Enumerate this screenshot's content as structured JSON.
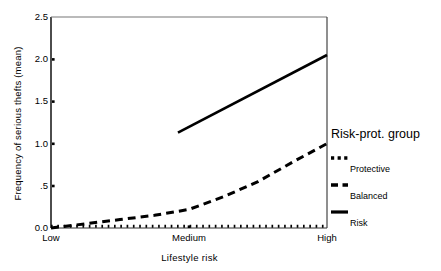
{
  "chart_data": {
    "type": "line",
    "title": "",
    "xlabel": "Lifestyle risk",
    "ylabel": "Frequency of serious thefts (mean)",
    "categories": [
      "Low",
      "Medium",
      "High"
    ],
    "x": [
      0,
      1,
      2
    ],
    "xlim": [
      0,
      2
    ],
    "ylim": [
      0.0,
      2.5
    ],
    "yticks": [
      0.0,
      0.5,
      1.0,
      1.5,
      2.0,
      2.5
    ],
    "ytick_labels": [
      "0.0",
      ".5",
      "1.0",
      "1.5",
      "2.0",
      "2.5"
    ],
    "xtick_labels": [
      "Low",
      "Medium",
      "High"
    ],
    "grid": false,
    "legend_position": "right",
    "legend_title": "Risk-prot. group",
    "series": [
      {
        "name": "Protective",
        "style": "dotted",
        "color": "#000000",
        "values": [
          0.02,
          0.02,
          0.02
        ],
        "points": [
          {
            "x": 0.0,
            "y": 0.02
          },
          {
            "x": 1.0,
            "y": 0.02
          },
          {
            "x": 2.0,
            "y": 0.02
          }
        ]
      },
      {
        "name": "Balanced",
        "style": "dashed",
        "color": "#000000",
        "values": [
          0.0,
          0.22,
          1.0
        ],
        "points": [
          {
            "x": 0.0,
            "y": 0.0
          },
          {
            "x": 0.25,
            "y": 0.05
          },
          {
            "x": 0.5,
            "y": 0.1
          },
          {
            "x": 0.75,
            "y": 0.15
          },
          {
            "x": 1.0,
            "y": 0.22
          },
          {
            "x": 1.25,
            "y": 0.37
          },
          {
            "x": 1.5,
            "y": 0.55
          },
          {
            "x": 1.75,
            "y": 0.78
          },
          {
            "x": 2.0,
            "y": 1.0
          }
        ]
      },
      {
        "name": "Risk",
        "style": "solid",
        "color": "#000000",
        "values": [
          null,
          1.13,
          2.05
        ],
        "points": [
          {
            "x": 0.92,
            "y": 1.13
          },
          {
            "x": 2.0,
            "y": 2.05
          }
        ]
      }
    ],
    "legend_entries": [
      {
        "label": "Protective",
        "style": "dotted"
      },
      {
        "label": "Balanced",
        "style": "dashed"
      },
      {
        "label": "Risk",
        "style": "solid"
      }
    ]
  },
  "axes": {
    "plot_left_px": 51,
    "plot_right_px": 327,
    "plot_top_px": 17,
    "plot_bottom_px": 228
  }
}
